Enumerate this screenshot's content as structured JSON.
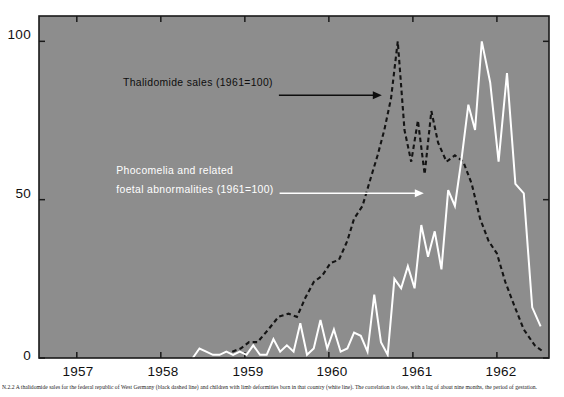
{
  "chart_data": {
    "type": "line",
    "title": "",
    "xlabel": "",
    "ylabel": "",
    "xlim": [
      1956.55,
      1962.62
    ],
    "ylim": [
      0,
      108
    ],
    "grid": false,
    "legend_position": "inline-annotations",
    "background_color": "#8d8d8d",
    "x_ticks": [
      1957,
      1958,
      1959,
      1960,
      1961,
      1962
    ],
    "x_tick_labels": [
      "1957",
      "1958",
      "1959",
      "1960",
      "1961",
      "1962"
    ],
    "y_ticks": [
      0,
      50,
      100
    ],
    "y_tick_labels": [
      "0",
      "50",
      "100"
    ],
    "series": [
      {
        "name": "Thalidomide sales (1961=100)",
        "style": "dashed",
        "color": "#141414",
        "x": [
          1958.85,
          1958.95,
          1959.05,
          1959.15,
          1959.28,
          1959.4,
          1959.52,
          1959.62,
          1959.72,
          1959.82,
          1959.92,
          1960.02,
          1960.12,
          1960.22,
          1960.3,
          1960.4,
          1960.5,
          1960.58,
          1960.66,
          1960.74,
          1960.82,
          1960.9,
          1960.98,
          1961.06,
          1961.14,
          1961.22,
          1961.3,
          1961.4,
          1961.5,
          1961.6,
          1961.7,
          1961.8,
          1961.9,
          1962.0,
          1962.1,
          1962.2,
          1962.32,
          1962.45,
          1962.55
        ],
        "y": [
          2,
          3,
          5,
          5,
          9,
          13,
          14,
          13,
          19,
          24,
          26,
          30,
          31,
          37,
          44,
          48,
          57,
          64,
          72,
          82,
          100,
          72,
          62,
          75,
          58,
          78,
          68,
          62,
          64,
          62,
          55,
          44,
          37,
          33,
          24,
          17,
          9,
          4,
          2
        ],
        "peak": {
          "x": 1960.82,
          "y": 100
        }
      },
      {
        "name": "Phocomelia and related foetal abnormalities (1961=100)",
        "style": "solid",
        "color": "#ffffff",
        "x": [
          1958.38,
          1958.46,
          1958.54,
          1958.62,
          1958.7,
          1958.78,
          1958.86,
          1958.94,
          1959.02,
          1959.1,
          1959.18,
          1959.26,
          1959.34,
          1959.42,
          1959.5,
          1959.58,
          1959.66,
          1959.74,
          1959.82,
          1959.9,
          1959.98,
          1960.06,
          1960.14,
          1960.22,
          1960.3,
          1960.38,
          1960.46,
          1960.54,
          1960.62,
          1960.7,
          1960.78,
          1960.86,
          1960.94,
          1961.02,
          1961.1,
          1961.18,
          1961.26,
          1961.34,
          1961.42,
          1961.5,
          1961.58,
          1961.66,
          1961.74,
          1961.82,
          1961.92,
          1962.02,
          1962.12,
          1962.22,
          1962.32,
          1962.42,
          1962.52
        ],
        "y": [
          0,
          3,
          2,
          1,
          1,
          2,
          1,
          2,
          1,
          4,
          1,
          1,
          6,
          2,
          4,
          2,
          11,
          1,
          3,
          12,
          3,
          9,
          2,
          3,
          8,
          7,
          2,
          20,
          5,
          1,
          25,
          22,
          29,
          22,
          42,
          32,
          40,
          28,
          53,
          48,
          63,
          80,
          72,
          100,
          87,
          62,
          90,
          55,
          52,
          16,
          10
        ],
        "peak": {
          "x": 1961.82,
          "y": 100
        }
      }
    ],
    "annotations": [
      {
        "name": "thalidomide-sales-label",
        "text": "Thalidomide sales (1961=100)",
        "color": "#0d0d0d",
        "text_x": 1957.55,
        "text_y": 86,
        "leader_to_x": 1960.63,
        "leader_to_y": 83,
        "arrow": "right"
      },
      {
        "name": "phocomelia-label-line1",
        "text": "Phocomelia and related",
        "color": "#ffffff",
        "text_x": 1957.47,
        "text_y": 58,
        "leader": false
      },
      {
        "name": "phocomelia-label-line2",
        "text": "foetal abnormalities (1961=100)",
        "color": "#ffffff",
        "text_x": 1957.47,
        "text_y": 52,
        "leader_to_x": 1961.13,
        "leader_to_y": 52,
        "arrow": "right"
      }
    ]
  },
  "caption": {
    "text": "N.2.2 A thalidomide sales for the federal republic of West Germany (black dashed line) and children with limb deformities born in that country (white line). The correlation is close, with a lag of about nine months, the period of gestation."
  }
}
